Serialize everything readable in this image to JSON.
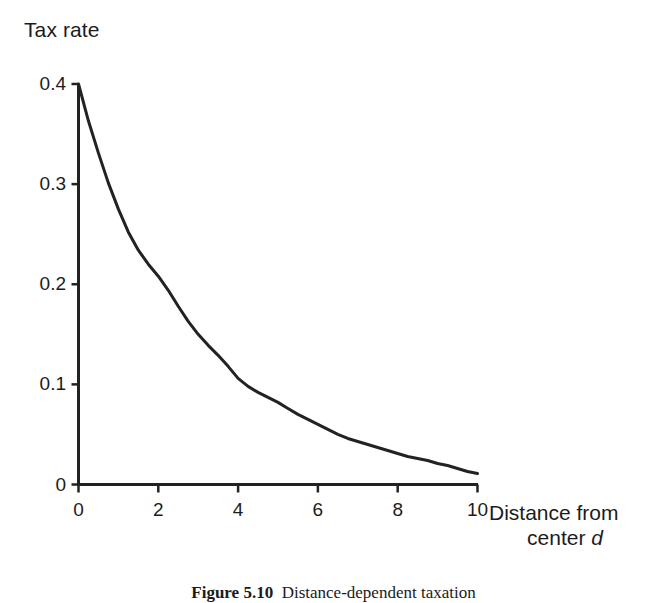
{
  "figure": {
    "caption_number": "Figure 5.10",
    "caption_text": "Distance-dependent taxation"
  },
  "axis_titles": {
    "y": "Tax rate",
    "x_line1": "Distance from",
    "x_line2_prefix": "center ",
    "x_line2_variable": "d"
  },
  "chart_data": {
    "type": "line",
    "title": "",
    "subtitle": "",
    "xlabel": "Distance from center d",
    "ylabel": "Tax rate",
    "xlim": [
      0,
      10
    ],
    "ylim": [
      0,
      0.4
    ],
    "grid": false,
    "legend": null,
    "xticks": [
      "0",
      "2",
      "4",
      "6",
      "8",
      "10"
    ],
    "xtick_values": [
      0,
      2,
      4,
      6,
      8,
      10
    ],
    "yticks": [
      "0",
      "0.1",
      "0.2",
      "0.3",
      "0.4"
    ],
    "ytick_values": [
      0,
      0.1,
      0.2,
      0.3,
      0.4
    ],
    "line_color": "#222222",
    "line_width": 3,
    "series": [
      {
        "name": "Tax rate",
        "x": [
          0,
          0.25,
          0.5,
          0.75,
          1,
          1.25,
          1.5,
          1.75,
          2,
          2.25,
          2.5,
          2.75,
          3,
          3.25,
          3.5,
          3.75,
          4,
          4.25,
          4.5,
          4.75,
          5,
          5.25,
          5.5,
          5.75,
          6,
          6.25,
          6.5,
          6.75,
          7,
          7.25,
          7.5,
          7.75,
          8,
          8.25,
          8.5,
          8.75,
          9,
          9.25,
          9.5,
          9.75,
          10
        ],
        "values": [
          0.4,
          0.363,
          0.331,
          0.301,
          0.275,
          0.252,
          0.234,
          0.22,
          0.208,
          0.194,
          0.178,
          0.163,
          0.15,
          0.139,
          0.129,
          0.118,
          0.106,
          0.098,
          0.092,
          0.087,
          0.082,
          0.076,
          0.07,
          0.065,
          0.06,
          0.055,
          0.05,
          0.046,
          0.043,
          0.04,
          0.037,
          0.034,
          0.031,
          0.028,
          0.026,
          0.024,
          0.021,
          0.019,
          0.016,
          0.013,
          0.011
        ]
      }
    ]
  }
}
